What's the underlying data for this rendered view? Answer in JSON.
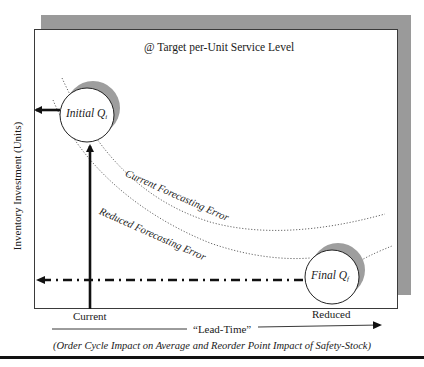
{
  "diagram": {
    "top_note": "@ Target per-Unit Service Level",
    "y_axis_label": "Inventory Investment (Units)",
    "x_axis_label": "“Lead-Time”",
    "x_ticks": {
      "current": "Current",
      "reduced": "Reduced"
    },
    "caption": "(Order Cycle Impact on Average and Reorder Point Impact of Safety-Stock)",
    "nodes": {
      "initial": {
        "label": "Initial Q",
        "subscript": "i"
      },
      "final": {
        "label": "Final Q",
        "subscript": "f"
      }
    },
    "curves": {
      "current": "Current Forecasting Error",
      "reduced": "Reduced Forecasting Error"
    },
    "colors": {
      "frame_shadow": "#9a9a9a",
      "circle_shadow": "#9e9e9e",
      "line": "#111111",
      "dotted_curve": "#555555"
    }
  }
}
